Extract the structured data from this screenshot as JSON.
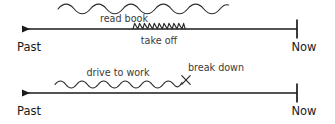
{
  "figure": {
    "background_color": "#ffffff",
    "line_color": "#1a1a1a",
    "squiggle_color": "#2b2b2b",
    "label_color": "#3a3a3a"
  },
  "timelines": [
    {
      "id": "timeline-top",
      "axis_y": 29,
      "left_label": "Past",
      "right_label": "Now",
      "left_arrow_x": 20,
      "right_tick_x": 297,
      "events": [
        {
          "id": "read-book",
          "label": "read book",
          "kind": "durative-squiggle",
          "position": "above-axis",
          "start_x": 58,
          "end_x": 228,
          "baseline_y": 9,
          "amplitude": 4.2,
          "wavelength": 21.5,
          "label_x": 124,
          "label_y": 21
        },
        {
          "id": "take-off",
          "label": "take off",
          "kind": "punctual-spring",
          "position": "on-axis",
          "start_x": 133,
          "end_x": 185,
          "baseline_y": 29,
          "amplitude": 5.5,
          "wavelength": 6.6,
          "label_x": 159,
          "label_y": 44
        }
      ]
    },
    {
      "id": "timeline-bottom",
      "axis_y": 93,
      "left_label": "Past",
      "right_label": "Now",
      "left_arrow_x": 20,
      "right_tick_x": 297,
      "events": [
        {
          "id": "drive-to-work",
          "label": "drive to work",
          "kind": "durative-squiggle",
          "position": "above-axis",
          "start_x": 55,
          "end_x": 182,
          "baseline_y": 84,
          "amplitude": 3.6,
          "wavelength": 14.5,
          "label_x": 118,
          "label_y": 75
        },
        {
          "id": "break-down",
          "label": "break down",
          "kind": "punctual-cross",
          "position": "above-axis",
          "cross_x": 186,
          "cross_y": 80,
          "cross_size": 4.4,
          "label_x": 215,
          "label_y": 71
        }
      ]
    }
  ],
  "labels": {
    "past": "Past",
    "now": "Now",
    "read_book": "read book",
    "take_off": "take off",
    "drive_to_work": "drive to work",
    "break_down": "break down"
  }
}
